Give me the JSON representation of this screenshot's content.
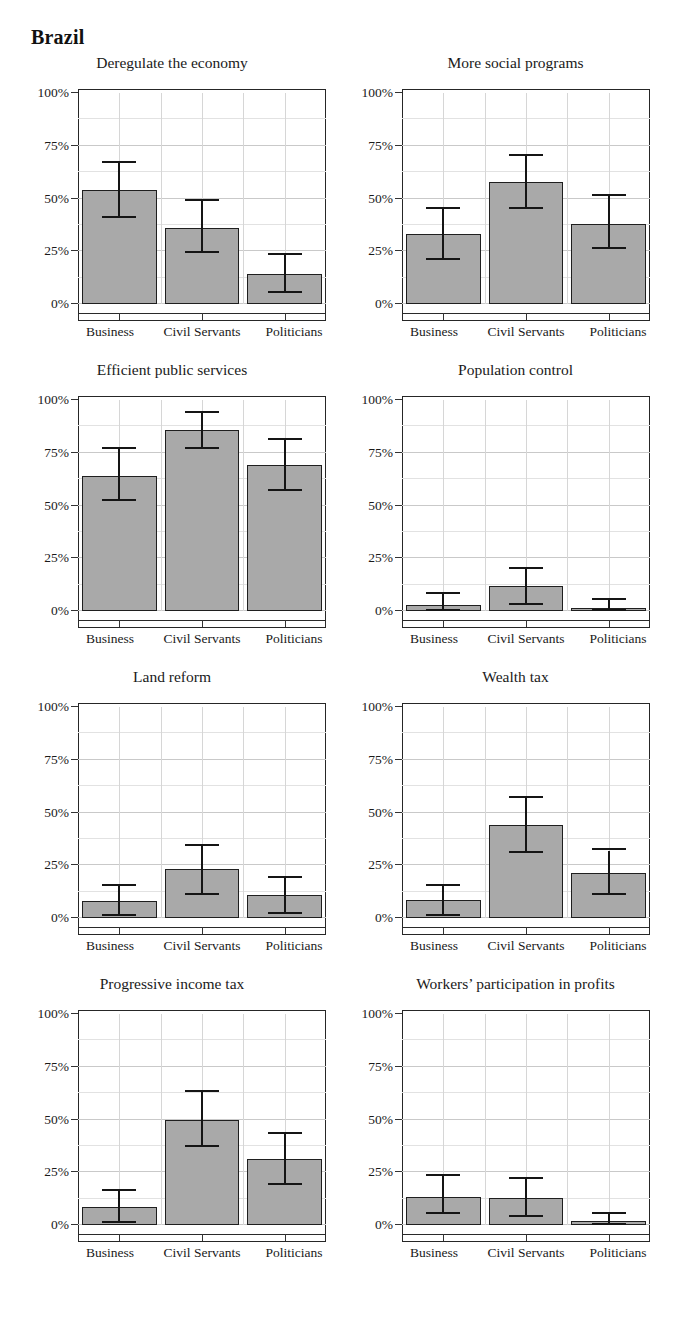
{
  "header": {
    "title": "Brazil"
  },
  "axes": {
    "y_ticks": [
      "0%",
      "25%",
      "50%",
      "75%",
      "100%"
    ],
    "y_tick_values": [
      0,
      25,
      50,
      75,
      100
    ],
    "y_minor_values": [
      12.5,
      37.5,
      62.5,
      87.5
    ],
    "categories": [
      "Business",
      "Civil Servants",
      "Politicians"
    ],
    "ylim": [
      0,
      100
    ]
  },
  "colors": {
    "bar_fill": "#a9a9a9",
    "bar_stroke": "#1f1f1f",
    "error_bar": "#151515",
    "frame": "#262626",
    "gridline_major": "#c9c9c9",
    "gridline_minor": "#e2e2e2",
    "text": "#1a1a1a",
    "background": "#ffffff"
  },
  "chart_data": [
    {
      "type": "bar",
      "title": "Deregulate the economy",
      "xlabel": "",
      "ylabel": "",
      "ylim": [
        0,
        100
      ],
      "grid": true,
      "legend": "none",
      "categories": [
        "Business",
        "Civil Servants",
        "Politicians"
      ],
      "values": [
        54,
        36,
        14
      ],
      "ci_low": [
        41,
        24,
        5
      ],
      "ci_high": [
        67,
        49,
        23
      ]
    },
    {
      "type": "bar",
      "title": "More social programs",
      "xlabel": "",
      "ylabel": "",
      "ylim": [
        0,
        100
      ],
      "grid": true,
      "legend": "none",
      "categories": [
        "Business",
        "Civil Servants",
        "Politicians"
      ],
      "values": [
        33,
        58,
        38
      ],
      "ci_low": [
        21,
        45,
        26
      ],
      "ci_high": [
        45,
        70,
        51
      ]
    },
    {
      "type": "bar",
      "title": "Efficient public services",
      "xlabel": "",
      "ylabel": "",
      "ylim": [
        0,
        100
      ],
      "grid": true,
      "legend": "none",
      "categories": [
        "Business",
        "Civil Servants",
        "Politicians"
      ],
      "values": [
        64,
        86,
        69
      ],
      "ci_low": [
        52,
        77,
        57
      ],
      "ci_high": [
        77,
        94,
        81
      ]
    },
    {
      "type": "bar",
      "title": "Population control",
      "xlabel": "",
      "ylabel": "",
      "ylim": [
        0,
        100
      ],
      "grid": true,
      "legend": "none",
      "categories": [
        "Business",
        "Civil Servants",
        "Politicians"
      ],
      "values": [
        3,
        12,
        1.5
      ],
      "ci_low": [
        0,
        3,
        0
      ],
      "ci_high": [
        8,
        20,
        5
      ]
    },
    {
      "type": "bar",
      "title": "Land reform",
      "xlabel": "",
      "ylabel": "",
      "ylim": [
        0,
        100
      ],
      "grid": true,
      "legend": "none",
      "categories": [
        "Business",
        "Civil Servants",
        "Politicians"
      ],
      "values": [
        8,
        23,
        11
      ],
      "ci_low": [
        1,
        11,
        2
      ],
      "ci_high": [
        15,
        34,
        19
      ]
    },
    {
      "type": "bar",
      "title": "Wealth tax",
      "xlabel": "",
      "ylabel": "",
      "ylim": [
        0,
        100
      ],
      "grid": true,
      "legend": "none",
      "categories": [
        "Business",
        "Civil Servants",
        "Politicians"
      ],
      "values": [
        8.5,
        44,
        21.5
      ],
      "ci_low": [
        1,
        31,
        11
      ],
      "ci_high": [
        15,
        57,
        32
      ]
    },
    {
      "type": "bar",
      "title": "Progressive income tax",
      "xlabel": "",
      "ylabel": "",
      "ylim": [
        0,
        100
      ],
      "grid": true,
      "legend": "none",
      "categories": [
        "Business",
        "Civil Servants",
        "Politicians"
      ],
      "values": [
        8.5,
        50,
        31.5
      ],
      "ci_low": [
        1,
        37,
        19
      ],
      "ci_high": [
        16,
        63,
        43
      ]
    },
    {
      "type": "bar",
      "title": "Workers’ participation in profits",
      "xlabel": "",
      "ylabel": "",
      "ylim": [
        0,
        100
      ],
      "grid": true,
      "legend": "none",
      "categories": [
        "Business",
        "Civil Servants",
        "Politicians"
      ],
      "values": [
        13.5,
        13,
        2
      ],
      "ci_low": [
        5,
        4,
        0
      ],
      "ci_high": [
        23,
        22,
        5
      ]
    }
  ]
}
